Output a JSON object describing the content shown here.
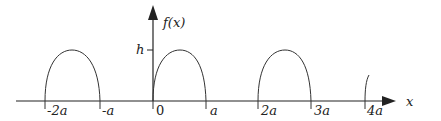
{
  "diagram": {
    "y_axis_label": "f(x)",
    "x_axis_label": "x",
    "height_label": "h",
    "ticks": [
      {
        "label": "-2a",
        "x": 45
      },
      {
        "label": "-a",
        "x": 100
      },
      {
        "label": "0",
        "x": 153
      },
      {
        "label": "a",
        "x": 206
      },
      {
        "label": "2a",
        "x": 258
      },
      {
        "label": "3a",
        "x": 311
      },
      {
        "label": "4a",
        "x": 365
      }
    ],
    "arches": [
      {
        "from": "-2a",
        "to": "-a"
      },
      {
        "from": "0",
        "to": "a"
      },
      {
        "from": "2a",
        "to": "3a"
      },
      {
        "from": "4a",
        "to": "partial"
      }
    ],
    "colors": {
      "stroke": "#222222",
      "background": "#ffffff"
    }
  }
}
